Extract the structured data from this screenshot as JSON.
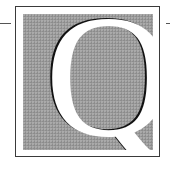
{
  "drop_cap": {
    "letter": "Q"
  },
  "colors": {
    "panel": "#9a9a9a",
    "frame": "#3a3a3a",
    "letter": "#ffffff",
    "letter_shadow": "#111111"
  }
}
